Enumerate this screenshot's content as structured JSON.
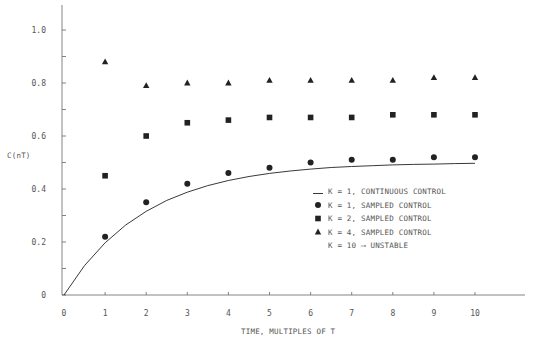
{
  "chart_data": {
    "type": "scatter",
    "title": "",
    "xlabel": "TIME, MULTIPLES OF T",
    "ylabel": "C(nT)",
    "xlim": [
      0,
      11.3
    ],
    "ylim": [
      0,
      1.1
    ],
    "grid": false,
    "legend_position": "right-middle",
    "x_ticks": [
      0,
      1,
      2,
      3,
      4,
      5,
      6,
      7,
      8,
      9,
      10
    ],
    "x_tick_labels": [
      "0",
      "1",
      "2",
      "3",
      "4",
      "5",
      "6",
      "7",
      "8",
      "9",
      "10"
    ],
    "y_ticks": [
      0,
      0.1,
      0.2,
      0.3,
      0.4,
      0.5,
      0.6,
      0.7,
      0.8,
      0.9,
      1.0
    ],
    "y_tick_labels": [
      {
        "value": 0,
        "label": "0"
      },
      {
        "value": 0.2,
        "label": "0.2"
      },
      {
        "value": 0.4,
        "label": "0.4"
      },
      {
        "value": 0.6,
        "label": "0.6"
      },
      {
        "value": 0.8,
        "label": "0.8"
      },
      {
        "value": 1.0,
        "label": "1.0"
      }
    ],
    "series": [
      {
        "name": "K = 1, CONTINUOUS CONTROL",
        "marker": "line",
        "style": "line",
        "x": [
          0,
          0.5,
          1,
          1.5,
          2,
          2.5,
          3,
          3.5,
          4,
          4.5,
          5,
          5.5,
          6,
          6.5,
          7,
          7.5,
          8,
          8.5,
          9,
          9.5,
          10
        ],
        "values": [
          0,
          0.111,
          0.197,
          0.264,
          0.316,
          0.357,
          0.388,
          0.413,
          0.432,
          0.447,
          0.459,
          0.468,
          0.475,
          0.481,
          0.485,
          0.488,
          0.491,
          0.493,
          0.494,
          0.496,
          0.497
        ]
      },
      {
        "name": "K = 1, SAMPLED CONTROL",
        "marker": "circle",
        "style": "points",
        "x": [
          1,
          2,
          3,
          4,
          5,
          6,
          7,
          8,
          9,
          10
        ],
        "values": [
          0.22,
          0.35,
          0.42,
          0.46,
          0.48,
          0.5,
          0.51,
          0.51,
          0.52,
          0.52
        ]
      },
      {
        "name": "K = 2, SAMPLED CONTROL",
        "marker": "square",
        "style": "points",
        "x": [
          1,
          2,
          3,
          4,
          5,
          6,
          7,
          8,
          9,
          10
        ],
        "values": [
          0.45,
          0.6,
          0.65,
          0.66,
          0.67,
          0.67,
          0.67,
          0.68,
          0.68,
          0.68
        ]
      },
      {
        "name": "K = 4, SAMPLED CONTROL",
        "marker": "triangle",
        "style": "points",
        "x": [
          1,
          2,
          3,
          4,
          5,
          6,
          7,
          8,
          9,
          10
        ],
        "values": [
          0.88,
          0.79,
          0.8,
          0.8,
          0.81,
          0.81,
          0.81,
          0.81,
          0.82,
          0.82
        ]
      }
    ],
    "annotations": [
      {
        "text": "K = 10 → UNSTABLE",
        "location": "legend"
      }
    ]
  },
  "legend": {
    "items": [
      {
        "symbol": "line",
        "label": "K = 1, CONTINUOUS CONTROL"
      },
      {
        "symbol": "circle",
        "label": "K = 1, SAMPLED CONTROL"
      },
      {
        "symbol": "square",
        "label": "K = 2, SAMPLED CONTROL"
      },
      {
        "symbol": "triangle",
        "label": "K = 4, SAMPLED CONTROL"
      },
      {
        "symbol": "none",
        "label": "K = 10 ⟶ UNSTABLE"
      }
    ]
  },
  "colors": {
    "ink": "#222222",
    "axis": "#666666",
    "text": "#555555",
    "background": "#ffffff"
  }
}
